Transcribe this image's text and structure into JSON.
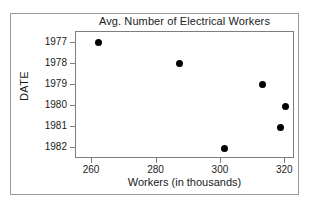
{
  "chart_data": {
    "type": "scatter",
    "title": "Avg. Number of Electrical Workers",
    "xlabel": "Workers (in thousands)",
    "ylabel": "DATE",
    "grid": false,
    "legend": null,
    "xlim": [
      255,
      323
    ],
    "ylim": [
      1976.5,
      1982.5
    ],
    "xticks": [
      260,
      280,
      300,
      320
    ],
    "xtick_labels": [
      "260",
      "280",
      "300",
      "320"
    ],
    "yticks": [
      1977,
      1978,
      1979,
      1980,
      1981,
      1982
    ],
    "ytick_labels": [
      "1977",
      "1978",
      "1979",
      "1980",
      "1981",
      "1982"
    ],
    "y_axis_inverted": true,
    "marker": "filled-circle",
    "marker_color": "#000000",
    "points": [
      {
        "x": 262,
        "y": 1977
      },
      {
        "x": 287,
        "y": 1978
      },
      {
        "x": 313,
        "y": 1979
      },
      {
        "x": 320,
        "y": 1980
      },
      {
        "x": 318.5,
        "y": 1981
      },
      {
        "x": 301,
        "y": 1982
      }
    ]
  },
  "figure": {
    "background_color": "#ffffff",
    "frame_color": "#9a9a9a",
    "axes_color": "#7d7d7d",
    "text_color": "#1a1a1a"
  }
}
